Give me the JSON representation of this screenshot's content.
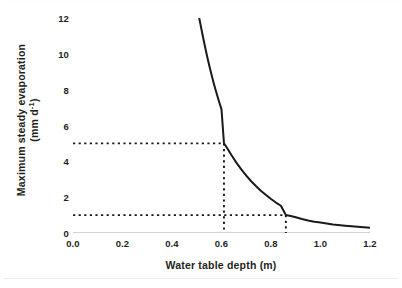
{
  "chart_data": {
    "type": "line",
    "title": "",
    "subtitle": "",
    "xlabel": "Water table depth (m)",
    "ylabel_line1": "Maximum steady evaporation",
    "ylabel_line2_pre": "(mm d",
    "ylabel_line2_sup": "-1",
    "ylabel_line2_post": ")",
    "ylabel_plain": "Maximum steady evaporation (mm d-1)",
    "xlim": [
      0.0,
      1.2
    ],
    "ylim": [
      0,
      12
    ],
    "xticks": [
      "0.0",
      "0.2",
      "0.4",
      "0.6",
      "0.8",
      "1.0",
      "1.2"
    ],
    "xtick_values": [
      0.0,
      0.2,
      0.4,
      0.6,
      0.8,
      1.0,
      1.2
    ],
    "yticks": [
      "0",
      "2",
      "4",
      "6",
      "8",
      "10",
      "12"
    ],
    "ytick_values": [
      0,
      2,
      4,
      6,
      8,
      10,
      12
    ],
    "grid": false,
    "legend": "none",
    "series": [
      {
        "name": "Maximum steady evaporation",
        "color": "#1a1a1a",
        "style": "solid",
        "x": [
          0.51,
          0.52,
          0.53,
          0.54,
          0.55,
          0.56,
          0.57,
          0.58,
          0.59,
          0.6,
          0.61,
          0.62,
          0.64,
          0.66,
          0.68,
          0.7,
          0.72,
          0.74,
          0.76,
          0.78,
          0.8,
          0.82,
          0.84,
          0.86,
          0.88,
          0.9,
          0.925,
          0.95,
          0.975,
          1.0,
          1.05,
          1.1,
          1.15,
          1.2
        ],
        "y": [
          12.0,
          11.3,
          10.62,
          9.98,
          9.38,
          8.82,
          8.29,
          7.8,
          7.34,
          6.9,
          5.0,
          4.8,
          4.35,
          3.93,
          3.55,
          3.2,
          2.89,
          2.61,
          2.35,
          2.12,
          1.9,
          1.7,
          1.52,
          1.0,
          0.95,
          0.88,
          0.78,
          0.7,
          0.63,
          0.58,
          0.48,
          0.41,
          0.35,
          0.3
        ]
      }
    ],
    "annotations": [
      {
        "name": "guide-upper",
        "type": "guide-lines",
        "style": "dotted",
        "color": "#1a1a1a",
        "y_value": 5,
        "x_value": 0.61,
        "description": "Horizontal dotted line at 5 mm d-1 from y-axis to curve, then vertical dotted line down to x = 0.61 m"
      },
      {
        "name": "guide-lower",
        "type": "guide-lines",
        "style": "dotted",
        "color": "#1a1a1a",
        "y_value": 1,
        "x_value": 0.86,
        "description": "Horizontal dotted line at 1 mm d-1 from y-axis to curve, then vertical dotted line down to x = 0.86 m"
      }
    ],
    "axis_spine": {
      "x_axis_visible": true,
      "x_axis_color": "#a6a6a6",
      "y_axis_visible": false,
      "tick_marks": "small, on x-axis only"
    }
  }
}
